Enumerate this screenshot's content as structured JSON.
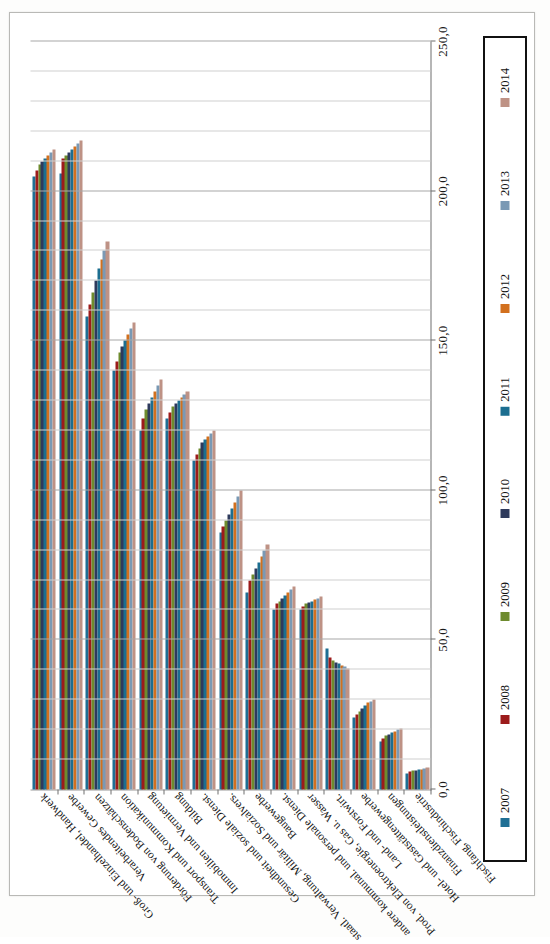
{
  "chart_data": {
    "type": "bar",
    "orientation": "horizontal",
    "title": "",
    "subtitle": "",
    "xlabel": "",
    "ylabel": "",
    "xlim": [
      0,
      250
    ],
    "xticks": [
      0,
      50,
      100,
      150,
      200,
      250
    ],
    "xticklabels": [
      "0,0",
      "50,0",
      "100,0",
      "150,0",
      "200,0",
      "250,0"
    ],
    "grid": true,
    "grid_axis": "x",
    "legend_position": "right",
    "legend_title": "",
    "categories": [
      "Groß- und Einzelhandel, Handwerk",
      "Verarbeitendes Gewerbe",
      "Förderung von Bodenschätzen",
      "Transport und Kommunikation",
      "Immobilien und Vermietung",
      "Bildung",
      "Gesundheit und soziale Dienst.",
      "staatl. Verwaltung, Militär und Sozialvers.",
      "Baugewerbe",
      "andere kommunal. und personale Dienst.",
      "Prod. von Elektroenergie, Gas u. Wasser",
      "Land- und Forstwirt.",
      "Hotel- und Gaststättengewerbe",
      "Finanzdienstleistungen",
      "Fischfang, Fischindustrie"
    ],
    "series": [
      {
        "name": "2007",
        "color": "#1F6F94",
        "values": [
          205.0,
          206.0,
          158.0,
          140.0,
          120.0,
          124.0,
          110.0,
          86.0,
          66.0,
          60.0,
          60.0,
          47.0,
          24.0,
          16.0,
          5.5
        ]
      },
      {
        "name": "2008",
        "color": "#9C1B1B",
        "values": [
          207.0,
          211.0,
          162.0,
          143.0,
          124.0,
          126.0,
          112.0,
          88.0,
          70.0,
          62.0,
          61.0,
          44.0,
          25.0,
          17.0,
          6.0
        ]
      },
      {
        "name": "2009",
        "color": "#6E8B2E",
        "values": [
          209.0,
          212.0,
          166.0,
          146.0,
          127.0,
          128.0,
          114.0,
          90.0,
          72.0,
          63.0,
          62.0,
          43.0,
          26.0,
          18.0,
          6.2
        ]
      },
      {
        "name": "2010",
        "color": "#2E3A5C",
        "values": [
          210.0,
          213.0,
          170.0,
          148.0,
          129.0,
          129.0,
          116.0,
          92.0,
          74.0,
          64.0,
          62.5,
          42.5,
          27.0,
          18.5,
          6.4
        ]
      },
      {
        "name": "2011",
        "color": "#1C6E90",
        "values": [
          211.0,
          214.0,
          174.0,
          150.0,
          131.0,
          130.0,
          117.0,
          94.0,
          76.0,
          65.0,
          63.0,
          42.0,
          28.0,
          19.0,
          6.6
        ]
      },
      {
        "name": "2012",
        "color": "#D2701E",
        "values": [
          212.0,
          215.0,
          177.0,
          152.0,
          133.0,
          131.0,
          118.0,
          96.0,
          78.0,
          66.0,
          63.5,
          41.5,
          29.0,
          19.5,
          6.8
        ]
      },
      {
        "name": "2013",
        "color": "#7A99B4",
        "values": [
          213.0,
          216.0,
          180.0,
          154.0,
          135.0,
          132.0,
          119.0,
          98.0,
          80.0,
          67.0,
          64.0,
          41.0,
          29.5,
          20.0,
          7.0
        ]
      },
      {
        "name": "2014",
        "color": "#BE9285",
        "values": [
          214.0,
          217.0,
          183.0,
          156.0,
          137.0,
          133.0,
          120.0,
          100.0,
          82.0,
          68.0,
          64.5,
          40.5,
          30.0,
          20.5,
          7.2
        ]
      }
    ]
  },
  "legend": {
    "entries": [
      {
        "label": "2007",
        "color": "#1F6F94"
      },
      {
        "label": "2008",
        "color": "#9C1B1B"
      },
      {
        "label": "2009",
        "color": "#6E8B2E"
      },
      {
        "label": "2010",
        "color": "#2E3A5C"
      },
      {
        "label": "2011",
        "color": "#1C6E90"
      },
      {
        "label": "2012",
        "color": "#D2701E"
      },
      {
        "label": "2013",
        "color": "#7A99B4"
      },
      {
        "label": "2014",
        "color": "#BE9285"
      }
    ]
  }
}
